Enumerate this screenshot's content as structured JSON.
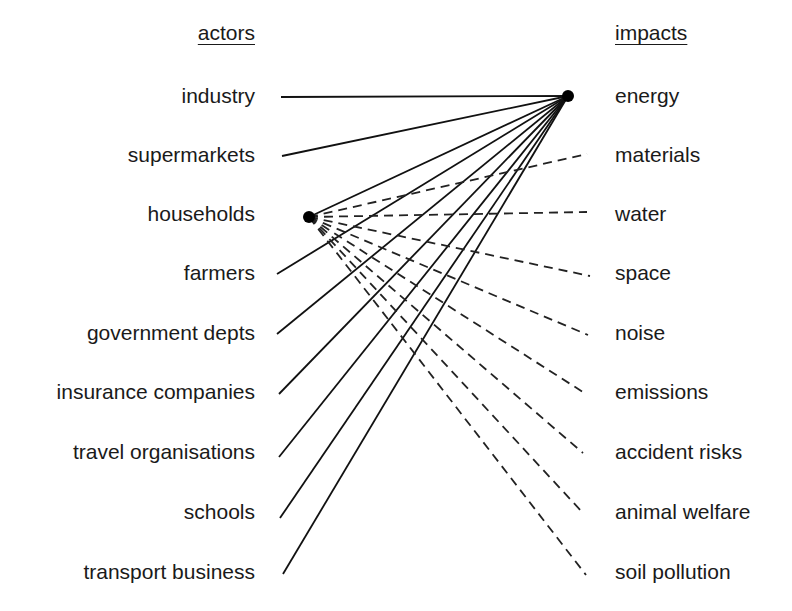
{
  "headers": {
    "actors": "actors",
    "impacts": "impacts"
  },
  "actors": [
    {
      "label": "industry",
      "y": 96,
      "end": [
        281,
        97
      ]
    },
    {
      "label": "supermarkets",
      "y": 155,
      "end": [
        282,
        156
      ]
    },
    {
      "label": "households",
      "y": 214,
      "end": [
        309,
        217
      ],
      "hub": true
    },
    {
      "label": "farmers",
      "y": 273,
      "end": [
        277,
        274
      ]
    },
    {
      "label": "government depts",
      "y": 333,
      "end": [
        277,
        334
      ]
    },
    {
      "label": "insurance companies",
      "y": 392,
      "end": [
        279,
        394
      ]
    },
    {
      "label": "travel organisations",
      "y": 452,
      "end": [
        279,
        457
      ]
    },
    {
      "label": "schools",
      "y": 512,
      "end": [
        280,
        518
      ]
    },
    {
      "label": "transport business",
      "y": 572,
      "end": [
        283,
        574
      ]
    }
  ],
  "impacts": [
    {
      "label": "energy",
      "y": 96,
      "end": [
        568,
        96
      ],
      "hub": true
    },
    {
      "label": "materials",
      "y": 155,
      "end": [
        587,
        154
      ]
    },
    {
      "label": "water",
      "y": 214,
      "end": [
        587,
        212
      ]
    },
    {
      "label": "space",
      "y": 273,
      "end": [
        590,
        276
      ]
    },
    {
      "label": "noise",
      "y": 333,
      "end": [
        588,
        335
      ]
    },
    {
      "label": "emissions",
      "y": 392,
      "end": [
        586,
        394
      ]
    },
    {
      "label": "accident risks",
      "y": 452,
      "end": [
        583,
        453
      ]
    },
    {
      "label": "animal welfare",
      "y": 512,
      "end": [
        583,
        513
      ]
    },
    {
      "label": "soil pollution",
      "y": 572,
      "end": [
        586,
        575
      ]
    }
  ],
  "hubs": {
    "energy": [
      568,
      96
    ],
    "households": [
      309,
      217
    ]
  },
  "style": {
    "line_color": "#111111",
    "dash_color": "#222222"
  }
}
